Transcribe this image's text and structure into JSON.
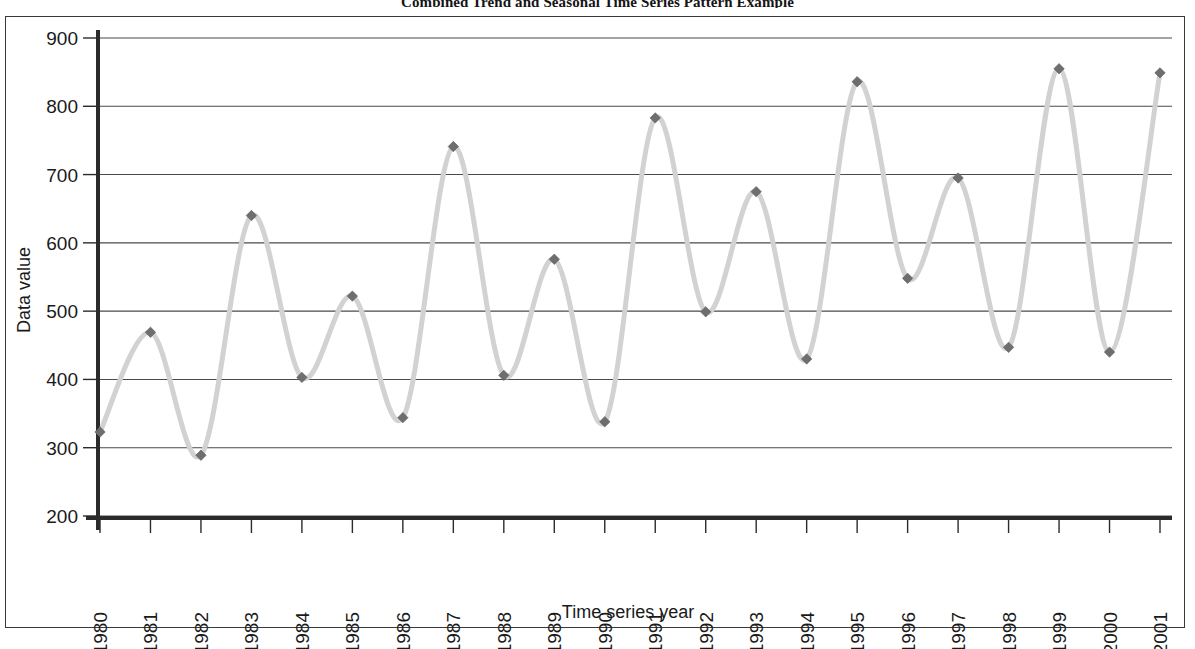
{
  "chart_data": {
    "type": "line",
    "title": "Combined Trend and Seasonal Time Series Pattern Example",
    "xlabel": "Time series year",
    "ylabel": "Data value",
    "ylim": [
      200,
      900
    ],
    "ytick_step": 100,
    "yticks": [
      "900",
      "800",
      "700",
      "600",
      "500",
      "400",
      "300",
      "200"
    ],
    "grid": true,
    "legend": false,
    "marker": "diamond",
    "line_color": "#d2d2d2",
    "marker_color": "#6e6e6e",
    "categories": [
      "1980",
      "1981",
      "1982",
      "1983",
      "1984",
      "1985",
      "1986",
      "1987",
      "1988",
      "1989",
      "1990",
      "1991",
      "1992",
      "1993",
      "1994",
      "1995",
      "1996",
      "1997",
      "1998",
      "1999",
      "2000",
      "2001"
    ],
    "values": [
      323,
      469,
      289,
      640,
      403,
      522,
      344,
      741,
      406,
      576,
      338,
      783,
      499,
      675,
      430,
      836,
      548,
      695,
      447,
      855,
      440,
      849
    ],
    "series": [
      {
        "name": "Data value",
        "values": [
          323,
          469,
          289,
          640,
          403,
          522,
          344,
          741,
          406,
          576,
          338,
          783,
          499,
          675,
          430,
          836,
          548,
          695,
          447,
          855,
          440,
          849
        ]
      }
    ]
  }
}
